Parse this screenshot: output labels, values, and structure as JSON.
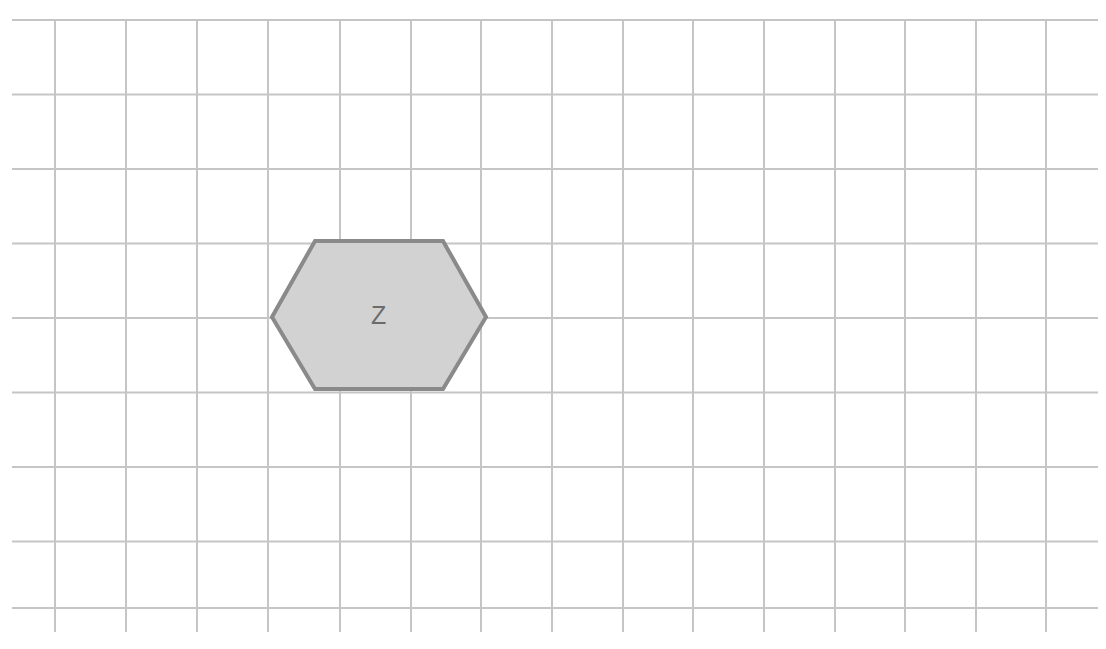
{
  "canvas": {
    "width": 1106,
    "height": 649,
    "background_color": "#ffffff",
    "name": "grid-paper-canvas"
  },
  "grid": {
    "line_color": "#c5c5c5",
    "line_width": 2,
    "vertical_spacing": 71,
    "horizontal_spacing": 74.5,
    "vertical_lines_x": [
      55,
      126,
      197,
      268,
      340,
      411,
      481,
      552,
      623,
      693,
      764,
      835,
      905,
      976,
      1046
    ],
    "horizontal_lines_y": [
      20,
      94.5,
      169,
      243.5,
      318,
      392.5,
      467,
      541.5,
      608
    ],
    "vertical_line_top": 20,
    "vertical_line_bottom": 632,
    "horizontal_line_left": 12,
    "horizontal_line_right": 1098
  },
  "shapes": [
    {
      "id": "hexagon-z",
      "kind": "hexagon",
      "label": "Z",
      "fill_color": "#d2d2d2",
      "stroke_color": "#8a8a8a",
      "stroke_width": 4,
      "label_color": "#6b6b6b",
      "label_font_size": 25,
      "center_x": 379,
      "center_y": 315,
      "left_x": 272,
      "right_x": 486,
      "top_y": 241,
      "bottom_y": 389,
      "flat_left_x": 315,
      "flat_right_x": 443,
      "points": "272,317 315,241 443,241 486,317 443,389 315,389"
    }
  ]
}
